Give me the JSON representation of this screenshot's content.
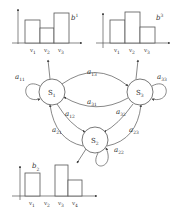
{
  "diagram": {
    "type": "hidden-markov-model",
    "states": [
      {
        "id": "S1",
        "label": "S",
        "sub": "1"
      },
      {
        "id": "S2",
        "label": "S",
        "sub": "2"
      },
      {
        "id": "S3",
        "label": "S",
        "sub": "3"
      }
    ],
    "transitions": [
      {
        "from": "S1",
        "to": "S1",
        "label": "a",
        "sub": "11"
      },
      {
        "from": "S1",
        "to": "S3",
        "label": "a",
        "sub": "13"
      },
      {
        "from": "S3",
        "to": "S1",
        "label": "a",
        "sub": "31"
      },
      {
        "from": "S3",
        "to": "S3",
        "label": "a",
        "sub": "33"
      },
      {
        "from": "S1",
        "to": "S2",
        "label": "a",
        "sub": "12"
      },
      {
        "from": "S2",
        "to": "S1",
        "label": "a",
        "sub": "21"
      },
      {
        "from": "S3",
        "to": "S2",
        "label": "a",
        "sub": "32"
      },
      {
        "from": "S2",
        "to": "S3",
        "label": "a",
        "sub": "23"
      },
      {
        "from": "S2",
        "to": "S2",
        "label": "a",
        "sub": "22"
      }
    ],
    "emissions": [
      {
        "state": "S1",
        "label": "b",
        "sup": "1",
        "categories": [
          "v1",
          "v2",
          "v3"
        ],
        "category_labels": [
          {
            "t": "v",
            "s": "1"
          },
          {
            "t": "v",
            "s": "2"
          },
          {
            "t": "v",
            "s": "3"
          }
        ],
        "values": [
          0.6,
          0.4,
          0.8
        ]
      },
      {
        "state": "S3",
        "label": "b",
        "sup": "3",
        "categories": [
          "v1",
          "v2",
          "v3"
        ],
        "category_labels": [
          {
            "t": "v",
            "s": "1"
          },
          {
            "t": "v",
            "s": "2"
          },
          {
            "t": "v",
            "s": "3"
          }
        ],
        "values": [
          0.6,
          0.85,
          0.4
        ]
      },
      {
        "state": "S2",
        "label": "b",
        "sup": "2",
        "categories": [
          "v1",
          "v2",
          "v3",
          "v4"
        ],
        "category_labels": [
          {
            "t": "v",
            "s": "1"
          },
          {
            "t": "v",
            "s": "2"
          },
          {
            "t": "v",
            "s": "3"
          },
          {
            "t": "v",
            "s": "4"
          }
        ],
        "values": [
          0.6,
          0,
          0.85,
          0.4
        ]
      }
    ]
  }
}
